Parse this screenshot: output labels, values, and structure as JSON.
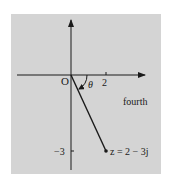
{
  "diagram": {
    "origin_label": "O",
    "angle_label": "θ",
    "x_tick_label": "2",
    "y_tick_label": "−3",
    "quadrant_label": "fourth",
    "point_label": "z = 2 − 3j",
    "point": {
      "re": 2,
      "im": -3
    },
    "colors": {
      "panel": "#d4d4d4",
      "ink": "#1a1a1a",
      "background": "#ffffff"
    }
  }
}
